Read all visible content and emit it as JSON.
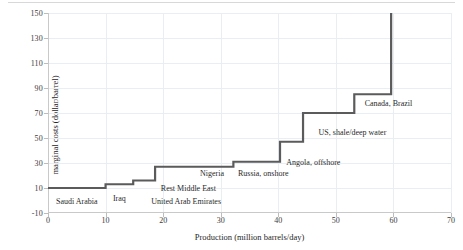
{
  "chart_data": {
    "type": "line",
    "subtype": "step-supply-curve",
    "title": "",
    "xlabel": "Production (million barrels/day)",
    "ylabel": "marginal costs (dollar/barrel)",
    "xlim": [
      0,
      70
    ],
    "ylim": [
      -10,
      150
    ],
    "xticks": [
      0,
      10,
      20,
      30,
      40,
      50,
      60,
      70
    ],
    "yticks": [
      -10,
      10,
      30,
      50,
      70,
      90,
      110,
      130,
      150
    ],
    "grid": true,
    "legend": "none",
    "line_color": "#5b5b5b",
    "grid_color": "#e9eef2",
    "steps": [
      {
        "name": "Saudi Arabia",
        "x_start": 0.0,
        "x_end": 10.0,
        "cost": 10
      },
      {
        "name": "Iraq",
        "x_start": 10.0,
        "x_end": 14.8,
        "cost": 13
      },
      {
        "name": "United Arab Emirates",
        "x_start": 14.8,
        "x_end": 18.6,
        "cost": 16
      },
      {
        "name": "Rest Middle East",
        "x_start": 18.6,
        "x_end": 26.0,
        "cost": 27
      },
      {
        "name": "Nigeria",
        "x_start": 26.0,
        "x_end": 32.2,
        "cost": 27
      },
      {
        "name": "Russia, onshore",
        "x_start": 32.2,
        "x_end": 40.3,
        "cost": 31
      },
      {
        "name": "Angola, offshore",
        "x_start": 40.3,
        "x_end": 44.3,
        "cost": 47
      },
      {
        "name": "US, shale/deep water",
        "x_start": 44.3,
        "x_end": 53.2,
        "cost": 70
      },
      {
        "name": "Canada, Brazil",
        "x_start": 53.2,
        "x_end": 59.6,
        "cost": 85
      },
      {
        "name": "",
        "x_start": 59.6,
        "x_end": 59.6,
        "cost": 150
      }
    ],
    "annotations": [
      {
        "text": "Saudi Arabia",
        "x": 5.0,
        "y": 0,
        "align": "center"
      },
      {
        "text": "Iraq",
        "x": 12.4,
        "y": 2,
        "align": "center"
      },
      {
        "text": "United Arab Emirates",
        "x": 24.0,
        "y": 0,
        "align": "center"
      },
      {
        "text": "Rest Middle East",
        "x": 19.6,
        "y": 10,
        "align": "left"
      },
      {
        "text": "Nigeria",
        "x": 26.4,
        "y": 22,
        "align": "left"
      },
      {
        "text": "Russia, onshore",
        "x": 33.0,
        "y": 22,
        "align": "left"
      },
      {
        "text": "Angola, offshore",
        "x": 41.4,
        "y": 31,
        "align": "left"
      },
      {
        "text": "US, shale/deep water",
        "x": 47.0,
        "y": 55,
        "align": "left"
      },
      {
        "text": "Canada, Brazil",
        "x": 55.0,
        "y": 78,
        "align": "left"
      }
    ]
  }
}
